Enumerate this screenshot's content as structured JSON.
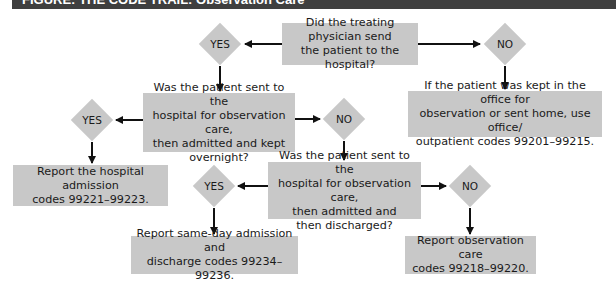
{
  "header": {
    "title": "FIGURE: THE CODE TRAIL: Observation Care"
  },
  "flowchart": {
    "q1": {
      "text": "Did the treating physician send\nthe patient to the hospital?"
    },
    "q1_yes": "YES",
    "q1_no": "NO",
    "q1_no_result": "If the patient was kept in the office for\nobservation or sent home, use office/\noutpatient codes 99201–99215.",
    "q2": {
      "text": "Was the patient sent to the\nhospital for observation care,\nthen admitted and kept\novernight?"
    },
    "q2_yes": "YES",
    "q2_no": "NO",
    "q2_yes_result": "Report the hospital admission\ncodes 99221–99223.",
    "q3": {
      "text": "Was the patient sent to the\nhospital for observation care,\nthen admitted and\nthen discharged?"
    },
    "q3_yes": "YES",
    "q3_no": "NO",
    "q3_yes_result": "Report same-day admission and\ndischarge codes 99234–99236.",
    "q3_no_result": "Report observation care\ncodes 99218–99220."
  },
  "colors": {
    "box_fill": "#c8c8c8",
    "header_bg": "#3f3f3f",
    "arrow": "#111111"
  }
}
